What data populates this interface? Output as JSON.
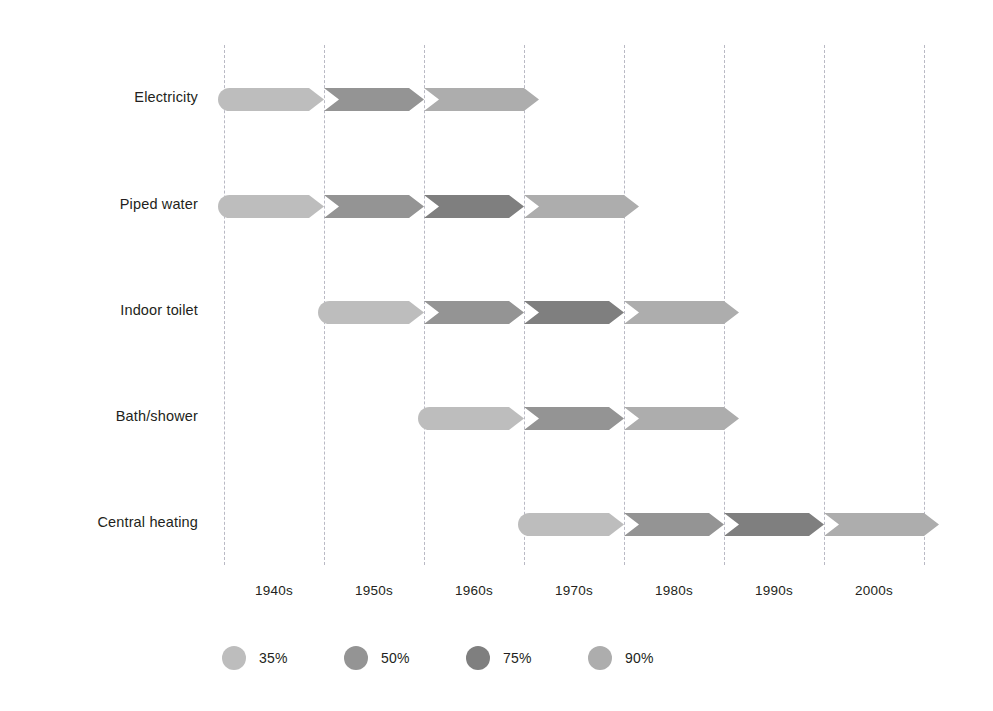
{
  "chart_data": {
    "type": "bar",
    "chart_style": "horizontal-stacked-timeline-arrow",
    "title": "",
    "subtitle": "",
    "xlabel": "",
    "ylabel": "",
    "grid": true,
    "legend_position": "bottom-left",
    "x_axis": {
      "tick_labels": [
        "1940s",
        "1950s",
        "1960s",
        "1970s",
        "1980s",
        "1990s",
        "2000s"
      ],
      "gridline_values": [
        1940,
        1950,
        1960,
        1970,
        1980,
        1990,
        2000,
        2010
      ],
      "xlim": [
        1940,
        2010
      ],
      "decade_width_px": 100
    },
    "categories": [
      "Electricity",
      "Piped water",
      "Indoor toilet",
      "Bath/shower",
      "Central heating"
    ],
    "legend": [
      {
        "label": "35%",
        "value": 35,
        "color": "#bdbdbd"
      },
      {
        "label": "50%",
        "value": 50,
        "color": "#949494"
      },
      {
        "label": "75%",
        "value": 75,
        "color": "#7f7f7f"
      },
      {
        "label": "90%",
        "value": 90,
        "color": "#adadad"
      }
    ],
    "series": [
      {
        "name": "Electricity",
        "start": 1940,
        "end": 1971,
        "segments": [
          {
            "level": "35%",
            "from": 1940,
            "to": 1950,
            "color": "#bdbdbd"
          },
          {
            "level": "50%",
            "from": 1950,
            "to": 1960,
            "color": "#949494"
          },
          {
            "level": "75%",
            "from": 1960,
            "to": 1970,
            "color": "#adadad"
          }
        ]
      },
      {
        "name": "Piped water",
        "start": 1940,
        "end": 1981,
        "segments": [
          {
            "level": "35%",
            "from": 1940,
            "to": 1950,
            "color": "#bdbdbd"
          },
          {
            "level": "50%",
            "from": 1950,
            "to": 1960,
            "color": "#949494"
          },
          {
            "level": "75%",
            "from": 1960,
            "to": 1970,
            "color": "#7f7f7f"
          },
          {
            "level": "90%",
            "from": 1970,
            "to": 1980,
            "color": "#adadad"
          }
        ]
      },
      {
        "name": "Indoor toilet",
        "start": 1950,
        "end": 1991,
        "segments": [
          {
            "level": "35%",
            "from": 1950,
            "to": 1960,
            "color": "#bdbdbd"
          },
          {
            "level": "50%",
            "from": 1960,
            "to": 1970,
            "color": "#949494"
          },
          {
            "level": "75%",
            "from": 1970,
            "to": 1980,
            "color": "#7f7f7f"
          },
          {
            "level": "90%",
            "from": 1980,
            "to": 1990,
            "color": "#adadad"
          }
        ]
      },
      {
        "name": "Bath/shower",
        "start": 1960,
        "end": 1991,
        "segments": [
          {
            "level": "35%",
            "from": 1960,
            "to": 1970,
            "color": "#bdbdbd"
          },
          {
            "level": "50%",
            "from": 1970,
            "to": 1980,
            "color": "#949494"
          },
          {
            "level": "75%",
            "from": 1980,
            "to": 1990,
            "color": "#adadad"
          }
        ]
      },
      {
        "name": "Central heating",
        "start": 1970,
        "end": 2011,
        "segments": [
          {
            "level": "35%",
            "from": 1970,
            "to": 1980,
            "color": "#bdbdbd"
          },
          {
            "level": "50%",
            "from": 1980,
            "to": 1990,
            "color": "#949494"
          },
          {
            "level": "75%",
            "from": 1990,
            "to": 2000,
            "color": "#7f7f7f"
          },
          {
            "level": "90%",
            "from": 2000,
            "to": 2010,
            "color": "#adadad"
          }
        ]
      }
    ]
  },
  "layout": {
    "origin_x": 224,
    "px_per_decade": 100,
    "bar_start_inset": 6,
    "arrow_len": 15,
    "row_tops": [
      78,
      185,
      291,
      397,
      503
    ],
    "grid_top": 45,
    "grid_height": 520,
    "gridline_color": "#b9b9c4"
  }
}
